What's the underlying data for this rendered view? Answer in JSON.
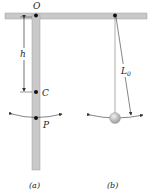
{
  "figure": {
    "panel_a": {
      "caption": "(a)",
      "pivot_label": "O",
      "dimension_label": "h",
      "center_label": "C",
      "point_label": "P"
    },
    "panel_b": {
      "caption": "(b)",
      "length_label": "L",
      "length_subscript": "0"
    }
  },
  "colors": {
    "bar_fill": "#c9c9c9",
    "bar_stroke": "#9a9a9a",
    "ink": "#222222",
    "ball": "#bdbdbd"
  }
}
